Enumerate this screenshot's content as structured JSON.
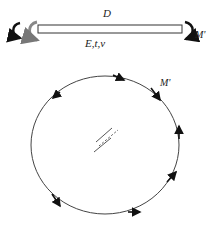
{
  "plate": {
    "label_top": "D",
    "label_bottom": "E,t,v",
    "moment_label": "M'"
  },
  "circle": {
    "moment_label": "M'",
    "arrow_count": 8
  },
  "colors": {
    "stroke": "#333333",
    "arrow_fill": "#111111",
    "left_moment_fill": "#888888"
  }
}
